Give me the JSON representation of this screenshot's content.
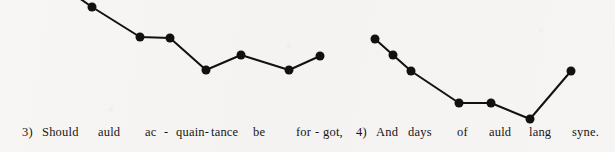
{
  "page": {
    "width": 615,
    "height": 152,
    "background_color": "#f6f5f3",
    "ink_color": "#111111"
  },
  "chart_data": {
    "type": "line",
    "title": "",
    "subtitle": "",
    "xlabel": "",
    "ylabel": "",
    "grid": false,
    "legend": null,
    "axis_visible": false,
    "note": "Melodic contour of Auld Lang Syne, phrases 3 and 4. Each marker is one sung syllable; vertical position is relative pitch (higher on the page = higher pitch). Pixel coordinates are read directly off the image; pitch_level is the inferred relative scale degree.",
    "ylim_pixels": [
      0,
      130
    ],
    "marker": {
      "shape": "circle",
      "diameter_px": 9,
      "color": "#111111"
    },
    "line": {
      "width_px": 2,
      "color": "#111111"
    },
    "series": [
      {
        "name": "phrase-3",
        "lyric": "Should auld ac-quain-tance be for-got,",
        "leads_in_from_offscreen": true,
        "lead_in_from": {
          "x": 56,
          "y": -18
        },
        "points": [
          {
            "x": 92,
            "y": 7,
            "syllable": "auld",
            "pitch_level": 8
          },
          {
            "x": 140,
            "y": 37,
            "syllable": "ac",
            "pitch_level": 6
          },
          {
            "x": 170,
            "y": 38,
            "syllable": "quain",
            "pitch_level": 6
          },
          {
            "x": 206,
            "y": 70,
            "syllable": "tance",
            "pitch_level": 4
          },
          {
            "x": 241,
            "y": 55,
            "syllable": "be",
            "pitch_level": 5
          },
          {
            "x": 289,
            "y": 70,
            "syllable": "for",
            "pitch_level": 4
          },
          {
            "x": 320,
            "y": 56,
            "syllable": "got",
            "pitch_level": 5
          }
        ]
      },
      {
        "name": "phrase-4",
        "lyric": "And days of auld lang syne.",
        "leads_in_from_offscreen": false,
        "points": [
          {
            "x": 375,
            "y": 39,
            "syllable": "And",
            "pitch_level": 6
          },
          {
            "x": 393,
            "y": 55,
            "syllable": "days",
            "pitch_level": 5
          },
          {
            "x": 411,
            "y": 71,
            "syllable": "days",
            "pitch_level": 4
          },
          {
            "x": 459,
            "y": 103,
            "syllable": "of",
            "pitch_level": 2
          },
          {
            "x": 491,
            "y": 103,
            "syllable": "auld",
            "pitch_level": 2
          },
          {
            "x": 530,
            "y": 119,
            "syllable": "lang",
            "pitch_level": 1
          },
          {
            "x": 571,
            "y": 71,
            "syllable": "syne",
            "pitch_level": 4
          }
        ]
      }
    ]
  },
  "lyrics": {
    "baseline_y": 138,
    "words": [
      {
        "text": "3)",
        "x": 22
      },
      {
        "text": "Should",
        "x": 42
      },
      {
        "text": "auld",
        "x": 98
      },
      {
        "text": "ac",
        "x": 145
      },
      {
        "text": "-",
        "x": 164
      },
      {
        "text": "quain-",
        "x": 176
      },
      {
        "text": "tance",
        "x": 211
      },
      {
        "text": "be",
        "x": 253
      },
      {
        "text": "for",
        "x": 296
      },
      {
        "text": "-",
        "x": 315
      },
      {
        "text": "got,",
        "x": 323
      },
      {
        "text": "4)",
        "x": 356
      },
      {
        "text": "And",
        "x": 376
      },
      {
        "text": "days",
        "x": 408
      },
      {
        "text": "of",
        "x": 457
      },
      {
        "text": "auld",
        "x": 489
      },
      {
        "text": "lang",
        "x": 529
      },
      {
        "text": "syne.",
        "x": 572
      }
    ]
  }
}
